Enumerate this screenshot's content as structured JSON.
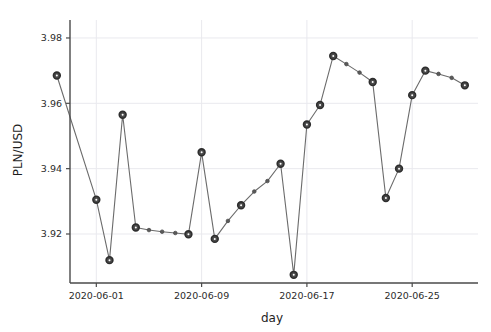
{
  "chart_data": {
    "type": "line",
    "title": "",
    "xlabel": "day",
    "ylabel": "PLN/USD",
    "grid": true,
    "legend": null,
    "xlim": [
      "2020-05-30",
      "2020-06-30"
    ],
    "ylim": [
      3.905,
      3.9855
    ],
    "yticks": [
      3.92,
      3.94,
      3.96,
      3.98
    ],
    "ytick_labels": [
      "3.92",
      "3.94",
      "3.96",
      "3.98"
    ],
    "xticks": [
      "2020-06-01",
      "2020-06-09",
      "2020-06-17",
      "2020-06-25"
    ],
    "xtick_labels": [
      "2020-06-01",
      "2020-06-09",
      "2020-06-17",
      "2020-06-25"
    ],
    "marker_styles": [
      "large",
      "small"
    ],
    "x": [
      "2020-05-29",
      "2020-06-01",
      "2020-06-02",
      "2020-06-03",
      "2020-06-04",
      "2020-06-05",
      "2020-06-06",
      "2020-06-07",
      "2020-06-08",
      "2020-06-09",
      "2020-06-10",
      "2020-06-11",
      "2020-06-12",
      "2020-06-13",
      "2020-06-14",
      "2020-06-15",
      "2020-06-16",
      "2020-06-17",
      "2020-06-18",
      "2020-06-19",
      "2020-06-20",
      "2020-06-21",
      "2020-06-22",
      "2020-06-23",
      "2020-06-24",
      "2020-06-25",
      "2020-06-26",
      "2020-06-27",
      "2020-06-28",
      "2020-06-29"
    ],
    "values": [
      3.9685,
      3.9305,
      3.912,
      3.9565,
      3.922,
      3.9212,
      3.9207,
      3.9203,
      3.9199,
      3.945,
      3.9185,
      3.924,
      3.9288,
      3.933,
      3.9362,
      3.9415,
      3.9075,
      3.9535,
      3.9595,
      3.9745,
      3.972,
      3.9694,
      3.9665,
      3.931,
      3.94,
      3.9625,
      3.97,
      3.969,
      3.9678,
      3.9655
    ],
    "marker_size_flags": [
      "large",
      "large",
      "large",
      "large",
      "large",
      "small",
      "small",
      "small",
      "large",
      "large",
      "large",
      "small",
      "large",
      "small",
      "small",
      "large",
      "large",
      "large",
      "large",
      "large",
      "small",
      "small",
      "large",
      "large",
      "large",
      "large",
      "large",
      "small",
      "small",
      "large"
    ],
    "colors": {
      "line": "#6b6b6b",
      "marker": "#4a4a4a",
      "grid": "#e9e9ee",
      "axis": "#4a4a4a",
      "background": "#ffffff",
      "text": "#2b2b2b"
    }
  }
}
